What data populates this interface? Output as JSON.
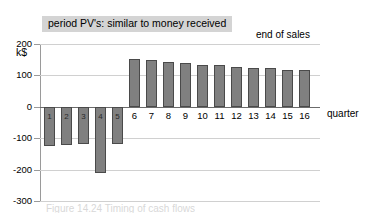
{
  "chart_data": {
    "type": "bar",
    "title": "period PV's: similar to money received",
    "xlabel": "quarter",
    "ylabel": "k$",
    "ylim": [
      -300,
      200
    ],
    "yticks": [
      200,
      100,
      0,
      -100,
      -200,
      -300
    ],
    "ytick_labels": [
      "200",
      "100",
      "0",
      "-100",
      "-200",
      "-300"
    ],
    "grid": true,
    "legend": "none",
    "categories": [
      "1",
      "2",
      "3",
      "4",
      "5",
      "6",
      "7",
      "8",
      "9",
      "10",
      "11",
      "12",
      "13",
      "14",
      "15",
      "16"
    ],
    "values": [
      -125,
      -122,
      -120,
      -210,
      -117,
      152,
      149,
      144,
      140,
      134,
      132,
      128,
      124,
      122,
      118,
      116
    ],
    "annotations": [
      {
        "text": "end of sales",
        "type": "vertical-dashed-marker",
        "after_category": "16"
      }
    ]
  },
  "banner": {
    "text": "period PV's: similar to money received"
  },
  "annotation": {
    "end_of_sales": "end of sales"
  },
  "axes": {
    "y_unit_label": "k$",
    "x_axis_title": "quarter",
    "y_ticks": [
      {
        "label": "200"
      },
      {
        "label": "100"
      },
      {
        "label": "0"
      },
      {
        "label": "-100"
      },
      {
        "label": "-200"
      },
      {
        "label": "-300"
      }
    ]
  },
  "bars": [
    {
      "label": "1",
      "value": -125,
      "sign": "negative"
    },
    {
      "label": "2",
      "value": -122,
      "sign": "negative"
    },
    {
      "label": "3",
      "value": -120,
      "sign": "negative"
    },
    {
      "label": "4",
      "value": -210,
      "sign": "negative"
    },
    {
      "label": "5",
      "value": -117,
      "sign": "negative"
    },
    {
      "label": "6",
      "value": 152,
      "sign": "positive"
    },
    {
      "label": "7",
      "value": 149,
      "sign": "positive"
    },
    {
      "label": "8",
      "value": 144,
      "sign": "positive"
    },
    {
      "label": "9",
      "value": 140,
      "sign": "positive"
    },
    {
      "label": "10",
      "value": 134,
      "sign": "positive"
    },
    {
      "label": "11",
      "value": 132,
      "sign": "positive"
    },
    {
      "label": "12",
      "value": 128,
      "sign": "positive"
    },
    {
      "label": "13",
      "value": 124,
      "sign": "positive"
    },
    {
      "label": "14",
      "value": 122,
      "sign": "positive"
    },
    {
      "label": "15",
      "value": 118,
      "sign": "positive"
    },
    {
      "label": "16",
      "value": 116,
      "sign": "positive"
    }
  ],
  "colors": {
    "bar_fill": "#808080",
    "bar_border": "#4a4a4a",
    "banner_bg": "#d4d4d4",
    "grid": "#d0d0d0",
    "axis": "#9a9a9a"
  },
  "caption": {
    "text": "Figure 14.24  Timing of cash flows"
  }
}
